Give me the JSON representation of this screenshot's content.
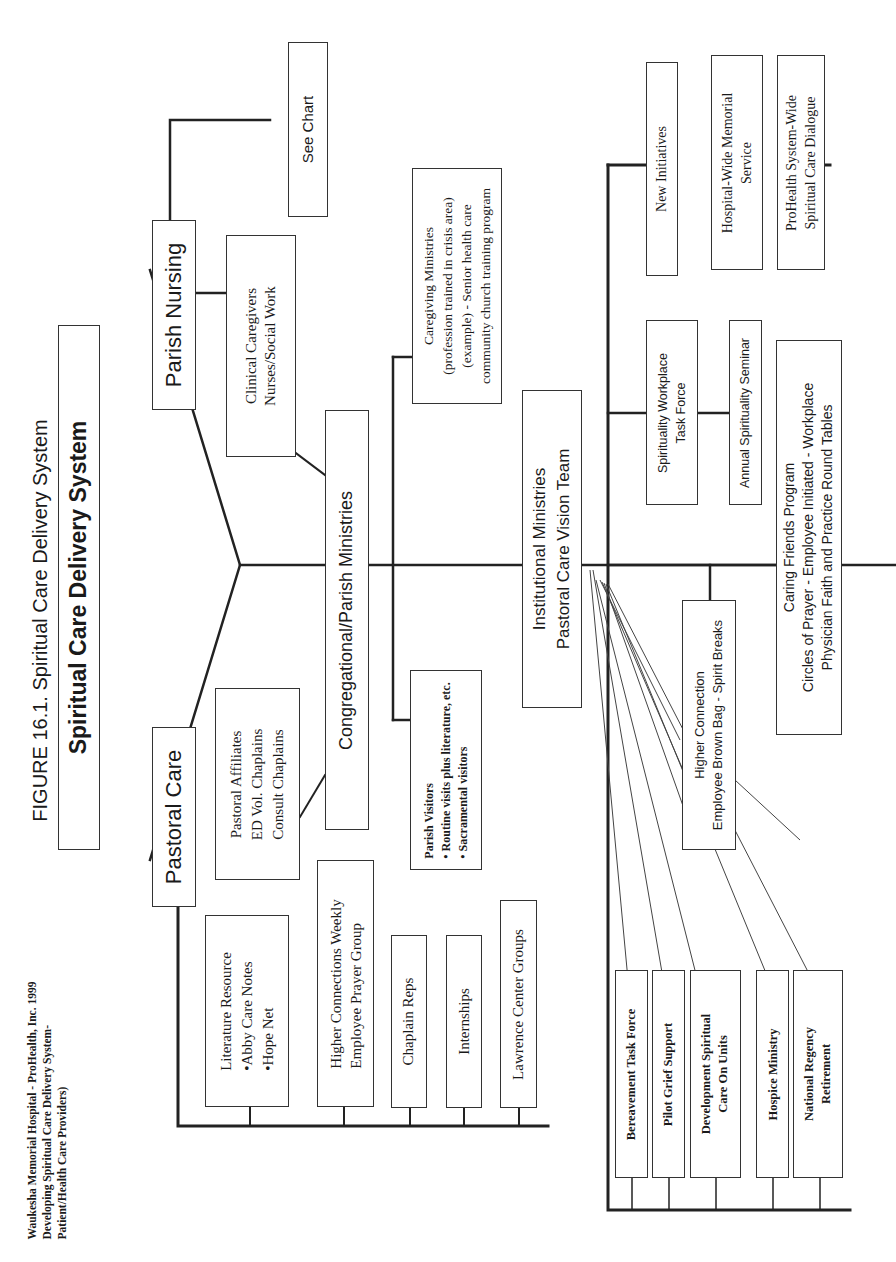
{
  "figure_title": "FIGURE 16.1. Spiritual Care Delivery System",
  "source_note": {
    "lines": [
      "Waukesha Memorial Hospital - ProHealth, Inc. 1999",
      "Developing Spiritual Care Delivery System-",
      "Patient/Health Care Providers)"
    ]
  },
  "root": {
    "label": "Spiritual Care Delivery System"
  },
  "branches": {
    "pastoral_care": {
      "label": "Pastoral Care",
      "affiliates": {
        "lines": [
          "Pastoral Affiliates",
          "ED Vol. Chaplains",
          "Consult Chaplains"
        ]
      },
      "children": [
        {
          "lines": [
            "Literature Resource",
            "•Abby Care Notes",
            "•Hope Net"
          ]
        },
        {
          "lines": [
            "Higher Connections Weekly",
            "Employee Prayer Group"
          ]
        },
        {
          "lines": [
            "Chaplain Reps"
          ]
        },
        {
          "lines": [
            "Internships"
          ]
        },
        {
          "lines": [
            "Lawrence Center  Groups"
          ]
        }
      ]
    },
    "parish_nursing": {
      "label": "Parish Nursing",
      "clinical": {
        "lines": [
          "Clinical Caregivers",
          "Nurses/Social Work"
        ]
      },
      "see_chart": {
        "label": "See Chart"
      }
    },
    "congregational": {
      "label": "Congregational/Parish Ministries",
      "parish_visitors": {
        "lines": [
          "Parish Visitors",
          "• Routine visits plus literature, etc.",
          "• Sacramental visitors"
        ]
      },
      "caregiving": {
        "lines": [
          "Caregiving Ministries",
          "(profession trained in crisis area)",
          "(example) - Senior health care",
          "community church training program"
        ]
      }
    },
    "institutional": {
      "lines": [
        "Institutional Ministries",
        "Pastoral Care Vision Team"
      ],
      "new_initiatives": {
        "label": "New Initiatives",
        "children": [
          {
            "lines": [
              "Hospital-Wide Memorial",
              "Service"
            ]
          },
          {
            "lines": [
              "ProHealth System-Wide",
              "Spiritual Care Dialogue"
            ]
          }
        ]
      },
      "workplace_task_force": {
        "lines": [
          "Spirituality Workplace",
          "Task Force"
        ],
        "seminar": {
          "lines": [
            "Annual Spirituality Seminar"
          ]
        }
      },
      "caring_friends": {
        "lines": [
          "Caring Friends Program",
          "Circles of Prayer - Employee Initiated - Workplace",
          "Physician Faith and Practice Round Tables"
        ]
      },
      "higher_connection": {
        "lines": [
          "Higher Connection",
          "Employee Brown Bag - Spirit Breaks"
        ]
      },
      "bottom_children": [
        {
          "lines": [
            "Bereavement Task Force"
          ]
        },
        {
          "lines": [
            "Pilot Grief Support"
          ]
        },
        {
          "lines": [
            "Development Spiritual",
            "Care On Units"
          ]
        },
        {
          "lines": [
            "Hospice Ministry"
          ]
        },
        {
          "lines": [
            "National Regency",
            "Retirement"
          ]
        }
      ]
    }
  }
}
